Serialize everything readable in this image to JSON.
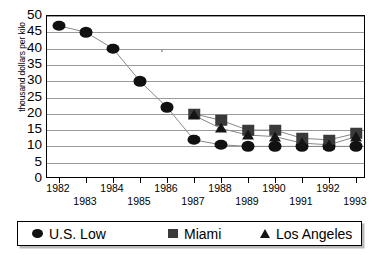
{
  "chart_data": {
    "type": "line",
    "title": "",
    "subtitle": "",
    "xlabel": "",
    "ylabel": "thousand dollars per kilo",
    "categories": [
      1982,
      1983,
      1984,
      1985,
      1986,
      1987,
      1988,
      1989,
      1990,
      1991,
      1992,
      1993
    ],
    "x_tick_labels": [
      "1982",
      "1983",
      "1984",
      "1985",
      "1986",
      "1987",
      "1988",
      "1989",
      "1990",
      "1991",
      "1992",
      "1993"
    ],
    "y_tick_labels": [
      "0",
      "5",
      "10",
      "15",
      "20",
      "25",
      "30",
      "35",
      "40",
      "45",
      "50"
    ],
    "y_ticks": [
      0,
      5,
      10,
      15,
      20,
      25,
      30,
      35,
      40,
      45,
      50
    ],
    "ylim": [
      0,
      50
    ],
    "xlim": [
      1982,
      1993
    ],
    "grid": "horizontal",
    "legend_position": "bottom",
    "series": [
      {
        "name": "U.S. Low",
        "marker": "circle",
        "color": "#111111",
        "x": [
          1982,
          1983,
          1984,
          1985,
          1986,
          1987,
          1988,
          1989,
          1990,
          1991,
          1992,
          1993
        ],
        "values": [
          47,
          45,
          40,
          30,
          22,
          12,
          10.5,
          10,
          10,
          10,
          10,
          10
        ]
      },
      {
        "name": "Miami",
        "marker": "square",
        "color": "#3a3a3a",
        "x": [
          1987,
          1988,
          1989,
          1990,
          1991,
          1992,
          1993
        ],
        "values": [
          20,
          18,
          15,
          15,
          12.5,
          12,
          14
        ]
      },
      {
        "name": "Los Angeles",
        "marker": "triangle",
        "color": "#141414",
        "x": [
          1987,
          1988,
          1989,
          1990,
          1991,
          1992,
          1993
        ],
        "values": [
          19.5,
          15.5,
          13.5,
          13,
          11,
          10.5,
          13
        ]
      }
    ]
  },
  "legend": {
    "entries": [
      {
        "label": "U.S. Low",
        "marker": "circle"
      },
      {
        "label": "Miami",
        "marker": "square"
      },
      {
        "label": "Los Angeles",
        "marker": "triangle"
      }
    ]
  }
}
